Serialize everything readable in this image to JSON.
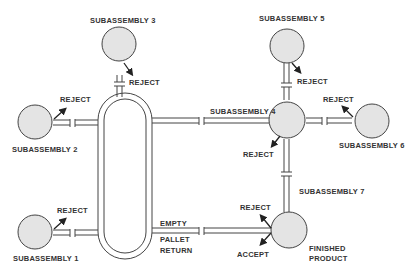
{
  "diagram": {
    "colors": {
      "station_fill": "#e4e4e4",
      "stroke": "#444444",
      "text": "#333333"
    },
    "stations": [
      {
        "id": "sub1",
        "label": "SUBASSEMBLY 1",
        "reject_label": "REJECT"
      },
      {
        "id": "sub2",
        "label": "SUBASSEMBLY 2",
        "reject_label": "REJECT"
      },
      {
        "id": "sub3",
        "label": "SUBASSEMBLY 3",
        "reject_label": "REJECT"
      },
      {
        "id": "sub4",
        "label": "SUBASSEMBLY 4",
        "reject_label": "REJECT"
      },
      {
        "id": "sub5",
        "label": "SUBASSEMBLY 5",
        "reject_label": "REJECT"
      },
      {
        "id": "sub6",
        "label": "SUBASSEMBLY 6",
        "reject_label": "REJECT"
      },
      {
        "id": "sub7",
        "label": "SUBASSEMBLY 7"
      },
      {
        "id": "finished",
        "label_line1": "FINISHED",
        "label_line2": "PRODUCT",
        "reject_label": "REJECT",
        "accept_label": "ACCEPT"
      }
    ],
    "return_line": {
      "line1": "EMPTY",
      "line2": "PALLET",
      "line3": "RETURN"
    }
  }
}
